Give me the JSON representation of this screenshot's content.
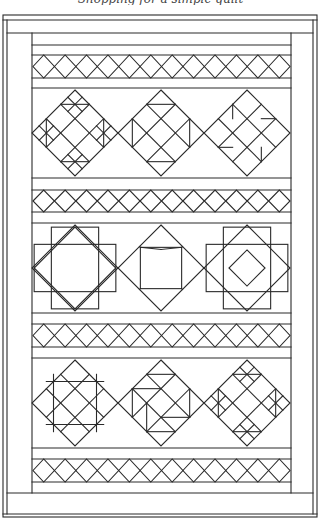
{
  "caption": "Shopping for a simple quilt",
  "quilt": {
    "title": "Sampler quilt line drawing",
    "ink_color": "#2a2a2a",
    "paper_color": "#ffffff",
    "lattice_strips": [
      {
        "name": "lattice-strip-1",
        "diamond_count": 12
      },
      {
        "name": "lattice-strip-2",
        "diamond_count": 12
      },
      {
        "name": "lattice-strip-3",
        "diamond_count": 12
      },
      {
        "name": "lattice-strip-4",
        "diamond_count": 12
      }
    ],
    "block_rows": [
      {
        "name": "block-row-1",
        "blocks": [
          {
            "name": "block-shoofly-variant",
            "pattern": "bars-cross"
          },
          {
            "name": "block-churn-dash",
            "pattern": "grid-triangles"
          },
          {
            "name": "block-pinwheel-star",
            "pattern": "pinwheel"
          }
        ]
      },
      {
        "name": "block-row-2",
        "blocks": [
          {
            "name": "block-square-in-square",
            "pattern": "square-frame"
          },
          {
            "name": "block-sawtooth-star",
            "pattern": "star"
          },
          {
            "name": "block-diamond-in-square",
            "pattern": "nested-diamond"
          }
        ]
      },
      {
        "name": "block-row-3",
        "blocks": [
          {
            "name": "block-nine-patch-grid",
            "pattern": "grid"
          },
          {
            "name": "block-broken-dishes",
            "pattern": "broken"
          },
          {
            "name": "block-double-bars",
            "pattern": "bars-cross"
          }
        ]
      }
    ]
  }
}
